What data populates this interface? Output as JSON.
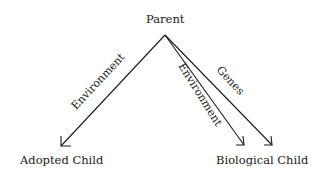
{
  "diagram": {
    "nodes": {
      "parent": "Parent",
      "adopted_child": "Adopted Child",
      "biological_child": "Biological Child"
    },
    "edges": [
      {
        "from": "Parent",
        "to": "Adopted Child",
        "label": "Environment"
      },
      {
        "from": "Parent",
        "to": "Biological Child",
        "label": "Environment"
      },
      {
        "from": "Parent",
        "to": "Biological Child",
        "label": "Genes"
      }
    ],
    "colors": {
      "line": "#1a1a1a",
      "background": "#ffffff"
    }
  }
}
